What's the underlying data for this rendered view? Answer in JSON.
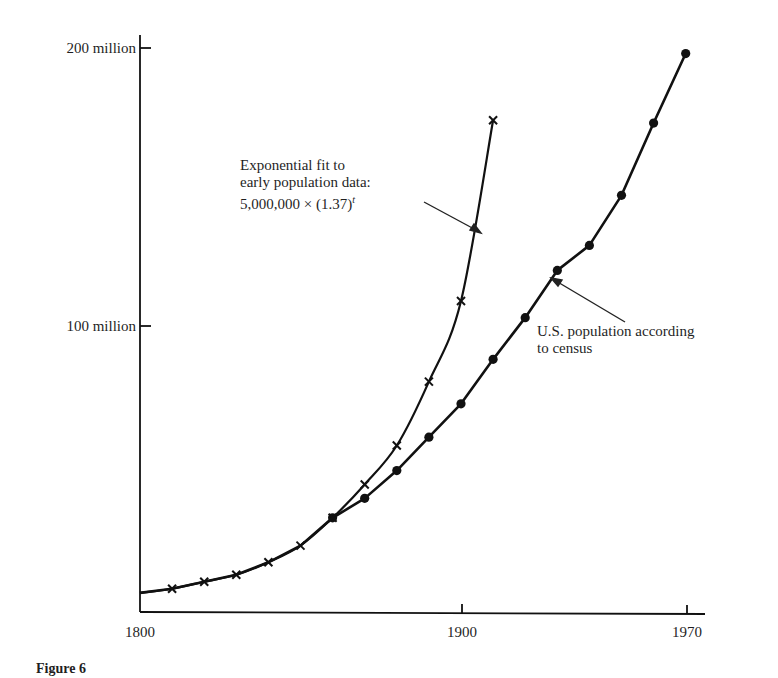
{
  "chart_data": {
    "type": "line",
    "title": "",
    "xlabel": "",
    "ylabel": "",
    "xlim": [
      1800,
      1975
    ],
    "ylim": [
      0,
      205
    ],
    "x_ticks": [
      {
        "value": 1800,
        "label": "1800"
      },
      {
        "value": 1900,
        "label": "1900"
      },
      {
        "value": 1970,
        "label": "1970"
      }
    ],
    "y_ticks": [
      {
        "value": 100,
        "label": "100 million"
      },
      {
        "value": 200,
        "label": "200 million"
      }
    ],
    "grid": false,
    "series": [
      {
        "name": "U.S. population according to census",
        "marker": "circle",
        "x": [
          1860,
          1870,
          1880,
          1890,
          1900,
          1910,
          1920,
          1930,
          1940,
          1950,
          1960,
          1970
        ],
        "values": [
          31,
          38,
          48,
          60,
          72,
          88,
          103,
          120,
          129,
          147,
          173,
          198
        ]
      },
      {
        "name": "Exponential fit to early population data",
        "marker": "x",
        "x": [
          1810,
          1820,
          1830,
          1840,
          1850,
          1860,
          1870,
          1880,
          1890,
          1900,
          1910
        ],
        "values": [
          5.5,
          8,
          10.5,
          15,
          21,
          31,
          43,
          57,
          80,
          109,
          174
        ]
      }
    ],
    "curve_start": {
      "x": 1800,
      "value": 4
    },
    "annotations": [
      {
        "text_lines": [
          "Exponential fit to",
          "early population data:",
          "5,000,000 × (1.37)"
        ],
        "superscript": "t",
        "points_to": "Exponential fit to early population data"
      },
      {
        "text_lines": [
          "U.S. population according",
          "to census"
        ],
        "points_to": "U.S. population according to census"
      }
    ]
  },
  "labels": {
    "y200": "200 million",
    "y100": "100 million",
    "x1800": "1800",
    "x1900": "1900",
    "x1970": "1970",
    "exp_line1": "Exponential fit to",
    "exp_line2": "early population data:",
    "exp_line3": "5,000,000 × (1.37)",
    "exp_sup": "t",
    "census_line1": "U.S. population according",
    "census_line2": "to census",
    "caption": "Figure 6"
  }
}
